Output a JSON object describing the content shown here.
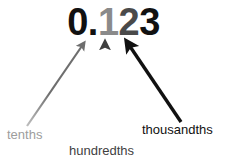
{
  "diagram": {
    "title_value": "0.123",
    "digits": [
      {
        "name": "integer-and-point",
        "text": "0.",
        "color": "#111111"
      },
      {
        "name": "tenths-digit",
        "text": "1",
        "color": "#8a8a8a"
      },
      {
        "name": "hundredths-digit",
        "text": "2",
        "color": "#4a4a4a"
      },
      {
        "name": "thousandths-digit",
        "text": "3",
        "color": "#111111"
      }
    ],
    "labels": [
      {
        "name": "tenths",
        "text": "tenths",
        "color": "#9d9d9d"
      },
      {
        "name": "hundredths",
        "text": "hundredths",
        "color": "#3f3f3f"
      },
      {
        "name": "thousandths",
        "text": "thousandths",
        "color": "#111111"
      }
    ],
    "arrows": [
      {
        "name": "tenths-arrow",
        "color": "#6e6e6e",
        "from": [
          27,
          126
        ],
        "to": [
          84,
          43
        ],
        "width": 2.2
      },
      {
        "name": "hundredths-arrow",
        "color": "#3f3f3f",
        "from": [
          105,
          141
        ],
        "to": [
          105,
          42
        ],
        "width": 2.6
      },
      {
        "name": "thousandths-arrow",
        "color": "#111111",
        "from": [
          181,
          122
        ],
        "to": [
          127,
          42
        ],
        "width": 3.4
      }
    ],
    "background_color": "#ffffff"
  }
}
